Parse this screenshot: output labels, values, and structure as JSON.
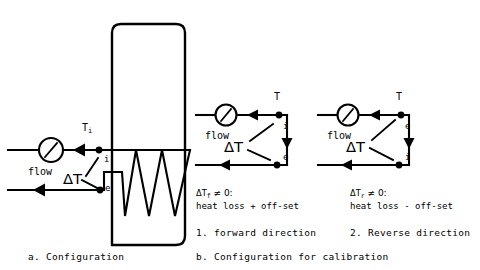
{
  "figure": {
    "type": "process-flow-schematic"
  },
  "panel_a": {
    "caption": "a. Configuration",
    "flow_label": "flow",
    "inlet_temp_label": "T",
    "inlet_temp_sub": "i",
    "junction_i": "i",
    "junction_e": "e",
    "delta_t_label": "ΔT",
    "vessel": {
      "name": "reactor-vessel",
      "coil_name": "heating-coil",
      "coil_peaks": 4
    },
    "meter_name": "flow-meter"
  },
  "panel_b": {
    "caption": "b. Configuration for calibration",
    "subpanels": [
      {
        "id": "forward",
        "flow_label": "flow",
        "top_label": "T",
        "top_junction": "i",
        "bottom_junction": "e",
        "delta_t_label": "ΔT",
        "equation_prefix": "ΔT",
        "equation_sub": "f",
        "equation_suffix": " ≠ 0:",
        "equation_line2": "heat loss + off-set",
        "title": "1. forward direction"
      },
      {
        "id": "reverse",
        "flow_label": "flow",
        "top_label": "T",
        "top_junction": "e",
        "bottom_junction": "i",
        "delta_t_label": "ΔT",
        "equation_prefix": "ΔT",
        "equation_sub": "r",
        "equation_suffix": " ≠ 0:",
        "equation_line2": "heat loss - off-set",
        "title": "2. Reverse direction"
      }
    ]
  },
  "colors": {
    "ink": "#000000",
    "background": "#ffffff"
  }
}
